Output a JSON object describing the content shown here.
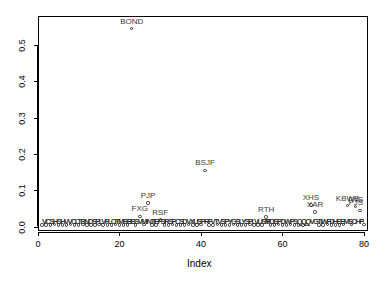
{
  "chart_data": {
    "type": "scatter",
    "title": "",
    "xlabel": "Index",
    "ylabel": "",
    "xlim": [
      0,
      81
    ],
    "ylim": [
      -0.012,
      0.58
    ],
    "grid": false,
    "legend": false,
    "marker": "open-circle",
    "xticks": [
      "0",
      "20",
      "40",
      "60",
      "80"
    ],
    "xtick_values": [
      0,
      20,
      40,
      60,
      80
    ],
    "yticks": [
      "0.0",
      "0.1",
      "0.2",
      "0.3",
      "0.4",
      "0.5"
    ],
    "ytick_values": [
      0.0,
      0.1,
      0.2,
      0.3,
      0.4,
      0.5
    ],
    "labeled_points": [
      {
        "label": "BOND",
        "x": 23,
        "y": 0.545
      },
      {
        "label": "BSJF",
        "x": 41,
        "y": 0.155
      },
      {
        "label": "PJP",
        "x": 27,
        "y": 0.065
      },
      {
        "label": "FXG",
        "x": 25,
        "y": 0.028
      },
      {
        "label": "RSF",
        "x": 30,
        "y": 0.018
      },
      {
        "label": "RTH",
        "x": 56,
        "y": 0.026
      },
      {
        "label": "XHS",
        "x": 67,
        "y": 0.06
      },
      {
        "label": "XAR",
        "x": 68,
        "y": 0.04
      },
      {
        "label": "KBWB",
        "x": 76,
        "y": 0.058
      },
      {
        "label": "IWS",
        "x": 78,
        "y": 0.055
      },
      {
        "label": "PJS",
        "x": 78,
        "y": 0.045
      }
    ],
    "x": [
      1,
      2,
      3,
      4,
      5,
      6,
      7,
      8,
      9,
      10,
      11,
      12,
      13,
      14,
      15,
      16,
      17,
      18,
      19,
      20,
      21,
      22,
      23,
      24,
      25,
      26,
      27,
      28,
      29,
      30,
      31,
      32,
      33,
      34,
      35,
      36,
      37,
      38,
      39,
      40,
      41,
      42,
      43,
      44,
      45,
      46,
      47,
      48,
      49,
      50,
      51,
      52,
      53,
      54,
      55,
      56,
      57,
      58,
      59,
      60,
      61,
      62,
      63,
      64,
      65,
      66,
      67,
      68,
      69,
      70,
      71,
      72,
      73,
      74,
      75,
      76,
      77,
      78,
      79,
      80
    ],
    "y": [
      0.004,
      0.005,
      0.004,
      0.006,
      0.005,
      0.004,
      0.005,
      0.006,
      0.004,
      0.005,
      0.006,
      0.004,
      0.005,
      0.004,
      0.006,
      0.005,
      0.004,
      0.005,
      0.006,
      0.004,
      0.005,
      0.004,
      0.545,
      0.005,
      0.028,
      0.006,
      0.065,
      0.005,
      0.004,
      0.018,
      0.005,
      0.004,
      0.006,
      0.005,
      0.004,
      0.005,
      0.006,
      0.004,
      0.005,
      0.006,
      0.155,
      0.005,
      0.004,
      0.006,
      0.005,
      0.004,
      0.005,
      0.006,
      0.004,
      0.005,
      0.004,
      0.006,
      0.005,
      0.004,
      0.005,
      0.026,
      0.005,
      0.004,
      0.006,
      0.005,
      0.004,
      0.006,
      0.005,
      0.004,
      0.005,
      0.006,
      0.06,
      0.04,
      0.005,
      0.004,
      0.006,
      0.005,
      0.004,
      0.005,
      0.006,
      0.058,
      0.006,
      0.055,
      0.045,
      0.006
    ],
    "dense_label_bands": [
      {
        "text": "VCSHSHVVCLTBNDSPLVFLOTMBBBSVMINTIEFSHYGSJNKHYGBKLNBSCEJPSTSRLNBLVFIXDMYNKIVWOBIL",
        "x_start": 1,
        "x_end": 32
      },
      {
        "text": "RSPCSDVXUSPRFVTVSPYGSLYSPLVUSMVMTUMJKDIVOEFAVSPYVXLBIVVLUEWLFQLVXLPVIGVPUSPHBPFF",
        "x_start": 31,
        "x_end": 57
      },
      {
        "text": "FDISPDWPSQQQVGTIWFIJHEEMSCHFVBKSPHDPJPXESGKCEBNDCE",
        "x_start": 56,
        "x_end": 80
      }
    ]
  }
}
